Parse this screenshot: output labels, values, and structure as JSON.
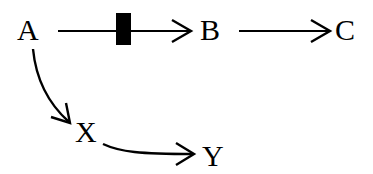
{
  "diagram": {
    "type": "directed-graph",
    "colors": {
      "ink": "#000000",
      "background": "#ffffff"
    },
    "nodes": {
      "A": {
        "label": "A"
      },
      "B": {
        "label": "B"
      },
      "C": {
        "label": "C"
      },
      "X": {
        "label": "X"
      },
      "Y": {
        "label": "Y"
      }
    },
    "edges": [
      {
        "from": "A",
        "to": "B",
        "style": "straight",
        "blocked": true
      },
      {
        "from": "B",
        "to": "C",
        "style": "straight",
        "blocked": false
      },
      {
        "from": "A",
        "to": "X",
        "style": "curved",
        "blocked": false
      },
      {
        "from": "X",
        "to": "Y",
        "style": "curved",
        "blocked": false
      }
    ]
  }
}
